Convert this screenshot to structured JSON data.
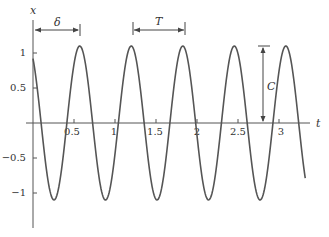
{
  "chart_data": {
    "type": "line",
    "title": "",
    "xlabel": "t",
    "ylabel": "x",
    "xlim": [
      0,
      3.3
    ],
    "ylim": [
      -1.3,
      1.3
    ],
    "xticks": [
      0.5,
      1,
      1.5,
      2,
      2.5,
      3
    ],
    "xtick_labels": [
      "0.5",
      "1",
      "1.5",
      "2",
      "2.5",
      "3"
    ],
    "yticks": [
      1,
      0.5,
      -0.5,
      -1
    ],
    "ytick_labels": [
      "1",
      "0.5",
      "-0.5",
      "-1"
    ],
    "grid": false,
    "function": "x(t) = C cos(omega (t - delta))",
    "params": {
      "C": 1.1,
      "T": 0.63,
      "omega": 10.0,
      "delta": 0.57
    },
    "annotations": [
      {
        "label": "δ",
        "type": "dimension",
        "from_t": 0,
        "to_t": 0.57,
        "desc": "phase shift: from origin to first peak"
      },
      {
        "label": "T",
        "type": "dimension",
        "from_t": 1.2,
        "to_t": 1.83,
        "desc": "period between consecutive peaks"
      },
      {
        "label": "C",
        "type": "dimension",
        "at_t": 2.8,
        "from_x": 0,
        "to_x": 1.1,
        "desc": "amplitude"
      }
    ],
    "series": [
      {
        "name": "x(t)",
        "color": "#555555"
      }
    ]
  },
  "labels": {
    "x_axis": "t",
    "y_axis": "x",
    "delta": "δ",
    "period": "T",
    "amplitude": "C",
    "xticks": [
      "0.5",
      "1",
      "1.5",
      "2",
      "2.5",
      "3"
    ],
    "yticks": [
      "1",
      "0.5",
      "−0.5",
      "−1"
    ]
  }
}
